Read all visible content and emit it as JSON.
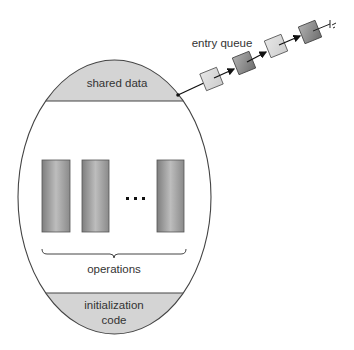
{
  "diagram": {
    "type": "monitor-structure",
    "labels": {
      "shared_data": "shared data",
      "entry_queue": "entry queue",
      "operations": "operations",
      "init_line1": "initialization",
      "init_line2": "code",
      "ellipsis": "..."
    },
    "colors": {
      "section_fill": "#d4d4d4",
      "outline": "#444444",
      "light_box": "#dcdcdc",
      "dark_box": "#8c8c8c",
      "operation_light": "#bdbdbd",
      "operation_dark": "#7e7e7e"
    },
    "entry_queue": {
      "items": [
        {
          "shade": "light"
        },
        {
          "shade": "dark"
        },
        {
          "shade": "light"
        },
        {
          "shade": "dark"
        }
      ],
      "terminator": "null-ground-symbol"
    },
    "operations": {
      "count_shown": 3,
      "has_ellipsis": true
    }
  }
}
